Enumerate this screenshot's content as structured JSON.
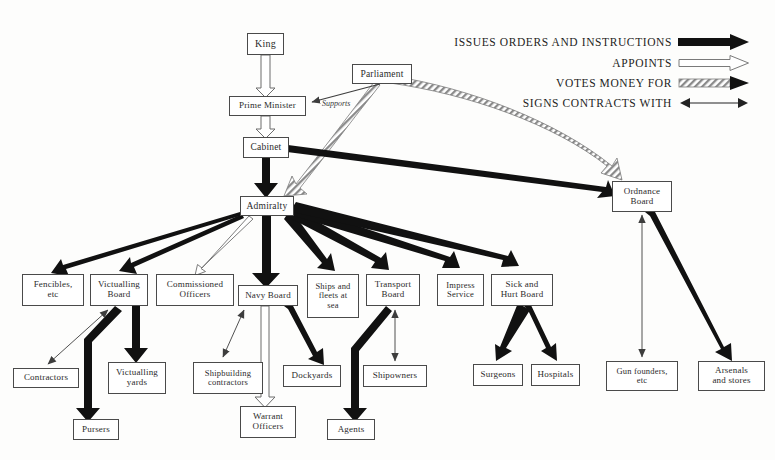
{
  "figure": {
    "title": "",
    "type": "organization-flow-diagram",
    "width": 775,
    "height": 460,
    "background_color": "#fdfdfc",
    "box_border_color": "#4a4a4a",
    "text_color": "#2b2b2b",
    "solid_arrow_color": "#111111",
    "thin_arrow_color": "#4a4a4a",
    "hatched_arrow_color": "#6b6b6b"
  },
  "legend": {
    "items": [
      {
        "label": "ISSUES ORDERS AND INSTRUCTIONS",
        "style": "thick-solid-black",
        "icon": "thick-solid-arrow-icon"
      },
      {
        "label": "APPOINTS",
        "style": "hollow-outline",
        "icon": "hollow-outline-arrow-icon"
      },
      {
        "label": "VOTES MONEY FOR",
        "style": "hatched",
        "icon": "hatched-arrow-icon"
      },
      {
        "label": "SIGNS CONTRACTS WITH",
        "style": "thin-double-headed",
        "icon": "double-headed-arrow-icon"
      }
    ]
  },
  "nodes": [
    {
      "id": "king",
      "label": "King",
      "x": 247,
      "y": 33,
      "w": 37,
      "h": 22,
      "font_size": 10
    },
    {
      "id": "prime-minister",
      "label": "Prime Minister",
      "x": 229,
      "y": 96,
      "w": 77,
      "h": 20,
      "font_size": 9
    },
    {
      "id": "cabinet",
      "label": "Cabinet",
      "x": 243,
      "y": 137,
      "w": 46,
      "h": 21,
      "font_size": 9.5
    },
    {
      "id": "parliament",
      "label": "Parliament",
      "x": 352,
      "y": 64,
      "w": 60,
      "h": 20,
      "font_size": 9.5
    },
    {
      "id": "admiralty",
      "label": "Admiralty",
      "x": 240,
      "y": 196,
      "w": 54,
      "h": 20,
      "font_size": 9.5
    },
    {
      "id": "ordnance-board",
      "label": "Ordnance\nBoard",
      "x": 612,
      "y": 181,
      "w": 60,
      "h": 31,
      "font_size": 9
    },
    {
      "id": "fencibles-etc",
      "label": "Fencibles,\netc",
      "x": 22,
      "y": 274,
      "w": 62,
      "h": 32,
      "font_size": 9
    },
    {
      "id": "victualling-board",
      "label": "Victualling\nBoard",
      "x": 90,
      "y": 274,
      "w": 58,
      "h": 32,
      "font_size": 9
    },
    {
      "id": "commissioned-officers",
      "label": "Commissioned\nOfficers",
      "x": 156,
      "y": 274,
      "w": 78,
      "h": 32,
      "font_size": 9
    },
    {
      "id": "navy-board",
      "label": "Navy Board",
      "x": 238,
      "y": 285,
      "w": 60,
      "h": 21,
      "font_size": 9
    },
    {
      "id": "ships-and-fleets",
      "label": "Ships and\nfleets at\nsea",
      "x": 307,
      "y": 274,
      "w": 52,
      "h": 44,
      "font_size": 8.5
    },
    {
      "id": "transport-board",
      "label": "Transport\nBoard",
      "x": 366,
      "y": 274,
      "w": 54,
      "h": 32,
      "font_size": 9
    },
    {
      "id": "impress-service",
      "label": "Impress\nService",
      "x": 437,
      "y": 274,
      "w": 47,
      "h": 32,
      "font_size": 8.5
    },
    {
      "id": "sick-and-hurt-board",
      "label": "Sick and\nHurt Board",
      "x": 491,
      "y": 274,
      "w": 62,
      "h": 32,
      "font_size": 9
    },
    {
      "id": "contractors",
      "label": "Contractors",
      "x": 13,
      "y": 368,
      "w": 66,
      "h": 20,
      "font_size": 9
    },
    {
      "id": "victualling-yards",
      "label": "Victualling\nyards",
      "x": 108,
      "y": 362,
      "w": 58,
      "h": 32,
      "font_size": 9
    },
    {
      "id": "shipbuilding-contractors",
      "label": "Shipbuilding\ncontractors",
      "x": 193,
      "y": 362,
      "w": 70,
      "h": 32,
      "font_size": 8.5
    },
    {
      "id": "dockyards",
      "label": "Dockyards",
      "x": 283,
      "y": 365,
      "w": 58,
      "h": 22,
      "font_size": 9
    },
    {
      "id": "shipowners",
      "label": "Shipowners",
      "x": 363,
      "y": 365,
      "w": 64,
      "h": 22,
      "font_size": 9
    },
    {
      "id": "surgeons",
      "label": "Surgeons",
      "x": 473,
      "y": 364,
      "w": 50,
      "h": 22,
      "font_size": 9
    },
    {
      "id": "hospitals",
      "label": "Hospitals",
      "x": 531,
      "y": 364,
      "w": 49,
      "h": 22,
      "font_size": 9
    },
    {
      "id": "gun-founders-etc",
      "label": "Gun founders,\netc",
      "x": 606,
      "y": 361,
      "w": 72,
      "h": 30,
      "font_size": 8.5
    },
    {
      "id": "arsenals-and-stores",
      "label": "Arsenals\nand stores",
      "x": 698,
      "y": 361,
      "w": 67,
      "h": 30,
      "font_size": 9
    },
    {
      "id": "warrant-officers",
      "label": "Warrant\nOfficers",
      "x": 240,
      "y": 406,
      "w": 56,
      "h": 32,
      "font_size": 9
    },
    {
      "id": "pursers",
      "label": "Pursers",
      "x": 73,
      "y": 419,
      "w": 46,
      "h": 21,
      "font_size": 9
    },
    {
      "id": "agents",
      "label": "Agents",
      "x": 327,
      "y": 419,
      "w": 48,
      "h": 21,
      "font_size": 9
    }
  ],
  "edge_labels": [
    {
      "text": "Supports",
      "x": 322,
      "y": 100
    }
  ],
  "edges": [
    {
      "from": "king",
      "to": "prime-minister",
      "style": "appoints"
    },
    {
      "from": "prime-minister",
      "to": "cabinet",
      "style": "appoints"
    },
    {
      "from": "parliament",
      "to": "prime-minister",
      "style": "signs",
      "label": "Supports"
    },
    {
      "from": "parliament",
      "to": "admiralty",
      "style": "votes-money"
    },
    {
      "from": "parliament",
      "to": "ordnance-board",
      "style": "votes-money"
    },
    {
      "from": "cabinet",
      "to": "admiralty",
      "style": "orders"
    },
    {
      "from": "cabinet",
      "to": "ordnance-board",
      "style": "orders"
    },
    {
      "from": "admiralty",
      "to": "fencibles-etc",
      "style": "orders"
    },
    {
      "from": "admiralty",
      "to": "victualling-board",
      "style": "orders"
    },
    {
      "from": "admiralty",
      "to": "commissioned-officers",
      "style": "appoints"
    },
    {
      "from": "admiralty",
      "to": "navy-board",
      "style": "orders"
    },
    {
      "from": "admiralty",
      "to": "ships-and-fleets",
      "style": "orders"
    },
    {
      "from": "admiralty",
      "to": "transport-board",
      "style": "orders"
    },
    {
      "from": "admiralty",
      "to": "impress-service",
      "style": "orders"
    },
    {
      "from": "admiralty",
      "to": "sick-and-hurt-board",
      "style": "orders"
    },
    {
      "from": "victualling-board",
      "to": "contractors",
      "style": "signs"
    },
    {
      "from": "victualling-board",
      "to": "victualling-yards",
      "style": "orders"
    },
    {
      "from": "victualling-board",
      "to": "pursers",
      "style": "orders"
    },
    {
      "from": "navy-board",
      "to": "shipbuilding-contractors",
      "style": "signs"
    },
    {
      "from": "navy-board",
      "to": "warrant-officers",
      "style": "appoints"
    },
    {
      "from": "navy-board",
      "to": "dockyards",
      "style": "orders"
    },
    {
      "from": "transport-board",
      "to": "shipowners",
      "style": "signs"
    },
    {
      "from": "transport-board",
      "to": "agents",
      "style": "orders"
    },
    {
      "from": "sick-and-hurt-board",
      "to": "surgeons",
      "style": "orders"
    },
    {
      "from": "sick-and-hurt-board",
      "to": "hospitals",
      "style": "orders"
    },
    {
      "from": "ordnance-board",
      "to": "gun-founders-etc",
      "style": "signs"
    },
    {
      "from": "ordnance-board",
      "to": "arsenals-and-stores",
      "style": "orders"
    }
  ]
}
